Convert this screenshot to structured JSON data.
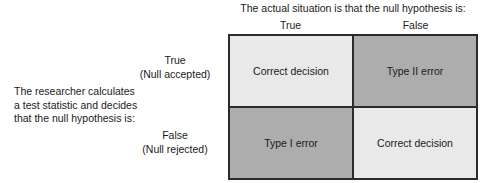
{
  "figure": {
    "column_group_title": "The actual situation is that the null hypothesis is:",
    "column_headers": [
      {
        "key": "true",
        "label": "True"
      },
      {
        "key": "false",
        "label": "False"
      }
    ],
    "row_group_caption": [
      "The researcher calculates",
      "a test statistic and decides",
      "that the null hypothesis is:"
    ],
    "row_headers": [
      {
        "key": "true",
        "label": "True",
        "sublabel": "(Null accepted)"
      },
      {
        "key": "false",
        "label": "False",
        "sublabel": "(Null rejected)"
      }
    ],
    "cells": [
      {
        "row": "true",
        "col": "true",
        "label": "Correct decision",
        "shade": "light"
      },
      {
        "row": "true",
        "col": "false",
        "label": "Type II error",
        "shade": "dark"
      },
      {
        "row": "false",
        "col": "true",
        "label": "Type I error",
        "shade": "dark"
      },
      {
        "row": "false",
        "col": "false",
        "label": "Correct decision",
        "shade": "light"
      }
    ],
    "colors": {
      "background": "#ffffff",
      "text": "#1a1a1a",
      "grid_line": "#2b2b2b",
      "shade_light": "#e9e9e9",
      "shade_dark": "#adadad"
    }
  }
}
